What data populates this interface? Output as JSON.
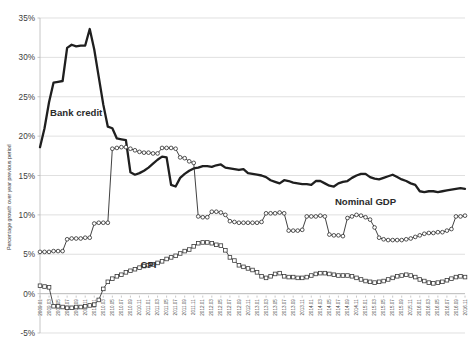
{
  "chart_data": {
    "type": "line",
    "title": "",
    "xlabel": "",
    "ylabel": "Percentage growth over year previous period",
    "ylim": [
      -5,
      35
    ],
    "ytick_labels": [
      "35%",
      "30%",
      "25%",
      "20%",
      "15%",
      "10%",
      "5%",
      "0%",
      "-5%"
    ],
    "ytick_values": [
      35,
      30,
      25,
      20,
      15,
      10,
      5,
      0,
      -5
    ],
    "grid": true,
    "legend_position": "inline-annotations",
    "annotations": [
      {
        "text": "Bank credit",
        "x": "2009.09",
        "y": 22.5
      },
      {
        "text": "Nominal GDP",
        "x": "2015.01",
        "y": 11.3
      },
      {
        "text": "CPI",
        "x": "2011.01",
        "y": 3.2
      }
    ],
    "x": [
      "2009.01",
      "2009.02",
      "2009.03",
      "2009.04",
      "2009.05",
      "2009.06",
      "2009.07",
      "2009.08",
      "2009.09",
      "2009.10",
      "2009.11",
      "2009.12",
      "2010.01",
      "2010.02",
      "2010.03",
      "2010.04",
      "2010.05",
      "2010.06",
      "2010.07",
      "2010.08",
      "2010.09",
      "2010.10",
      "2010.11",
      "2010.12",
      "2011.01",
      "2011.02",
      "2011.03",
      "2011.04",
      "2011.05",
      "2011.06",
      "2011.07",
      "2011.08",
      "2011.09",
      "2011.10",
      "2011.11",
      "2011.12",
      "2012.01",
      "2012.02",
      "2012.03",
      "2012.04",
      "2012.05",
      "2012.06",
      "2012.07",
      "2012.08",
      "2012.09",
      "2012.10",
      "2012.11",
      "2012.12",
      "2013.01",
      "2013.02",
      "2013.03",
      "2013.04",
      "2013.05",
      "2013.06",
      "2013.07",
      "2013.08",
      "2013.09",
      "2013.10",
      "2013.11",
      "2013.12",
      "2014.01",
      "2014.02",
      "2014.03",
      "2014.04",
      "2014.05",
      "2014.06",
      "2014.07",
      "2014.08",
      "2014.09",
      "2014.10",
      "2014.11",
      "2014.12",
      "2015.01",
      "2015.02",
      "2015.03",
      "2015.04",
      "2015.05",
      "2015.06",
      "2015.07",
      "2015.08",
      "2015.09",
      "2015.10",
      "2015.11",
      "2015.12",
      "2016.01",
      "2016.02",
      "2016.03",
      "2016.04",
      "2016.05",
      "2016.06",
      "2016.07",
      "2016.08",
      "2016.09",
      "2016.10",
      "2016.11"
    ],
    "xtick_labels": [
      "2009.01",
      "2009.03",
      "2009.05",
      "2009.07",
      "2009.09",
      "2009.11",
      "2010.01",
      "2010.03",
      "2010.05",
      "2010.07",
      "2010.09",
      "2010.11",
      "2011.01",
      "2011.03",
      "2011.05",
      "2011.07",
      "2011.09",
      "2011.11",
      "2012.01",
      "2012.03",
      "2012.05",
      "2012.07",
      "2012.09",
      "2012.11",
      "2013.01",
      "2013.03",
      "2013.05",
      "2013.07",
      "2013.09",
      "2013.11",
      "2014.01",
      "2014.03",
      "2014.05",
      "2014.07",
      "2014.09",
      "2014.11",
      "2015.01",
      "2015.03",
      "2015.05",
      "2015.07",
      "2015.09",
      "2015.11",
      "2016.01",
      "2016.03",
      "2016.05",
      "2016.07",
      "2016.09",
      "2016.11"
    ],
    "series": [
      {
        "name": "Bank credit",
        "marker": "none",
        "color": "#1f1f1f",
        "line_width": 2.3,
        "values": [
          18.6,
          21.0,
          24.3,
          26.8,
          26.9,
          27.0,
          31.2,
          31.6,
          31.4,
          31.5,
          31.5,
          33.6,
          31.0,
          27.5,
          24.0,
          21.2,
          21.0,
          19.7,
          19.6,
          19.5,
          15.4,
          15.1,
          15.3,
          15.6,
          16.0,
          16.5,
          17.0,
          17.4,
          17.3,
          13.8,
          13.6,
          14.7,
          15.2,
          15.6,
          15.9,
          16.0,
          16.2,
          16.2,
          16.1,
          16.3,
          16.4,
          16.0,
          15.9,
          15.8,
          15.7,
          15.8,
          15.3,
          15.2,
          15.1,
          15.0,
          14.8,
          14.4,
          14.2,
          14.0,
          14.4,
          14.3,
          14.1,
          14.0,
          13.9,
          13.9,
          13.8,
          14.3,
          14.3,
          14.0,
          13.7,
          13.6,
          14.0,
          14.2,
          14.3,
          14.7,
          15.0,
          15.2,
          15.2,
          14.8,
          14.6,
          14.5,
          14.7,
          14.9,
          15.1,
          14.8,
          14.5,
          14.3,
          14.0,
          13.8,
          13.0,
          12.9,
          13.0,
          13.0,
          12.9,
          13.0,
          13.1,
          13.2,
          13.3,
          13.4,
          13.3
        ]
      },
      {
        "name": "Nominal GDP",
        "marker": "circle",
        "color": "#2b2b2b",
        "line_width": 0.9,
        "values": [
          5.3,
          5.3,
          5.3,
          5.4,
          5.4,
          5.4,
          6.9,
          7.0,
          7.0,
          7.0,
          7.1,
          7.1,
          8.9,
          9.0,
          9.0,
          9.0,
          18.4,
          18.5,
          18.6,
          18.6,
          18.4,
          18.2,
          18.0,
          17.9,
          17.9,
          17.8,
          17.8,
          18.5,
          18.5,
          18.5,
          18.4,
          17.3,
          17.2,
          16.8,
          16.6,
          9.8,
          9.7,
          9.7,
          10.4,
          10.4,
          10.3,
          10.0,
          9.2,
          9.1,
          9.0,
          9.0,
          9.0,
          9.0,
          9.0,
          9.1,
          10.2,
          10.2,
          10.2,
          10.3,
          10.2,
          8.0,
          8.0,
          8.0,
          8.1,
          9.8,
          9.8,
          9.8,
          9.9,
          9.8,
          7.5,
          7.4,
          7.4,
          7.3,
          9.6,
          9.8,
          10.0,
          9.9,
          9.7,
          9.4,
          8.4,
          7.1,
          6.9,
          6.8,
          6.8,
          6.8,
          6.8,
          6.9,
          7.0,
          7.2,
          7.4,
          7.6,
          7.7,
          7.7,
          7.8,
          7.8,
          8.0,
          8.2,
          9.8,
          9.8,
          9.9
        ]
      },
      {
        "name": "CPI",
        "marker": "square",
        "color": "#3a3a3a",
        "line_width": 0.9,
        "values": [
          1.0,
          0.9,
          0.8,
          -1.6,
          -1.6,
          -1.7,
          -1.8,
          -1.8,
          -1.7,
          -1.7,
          -1.6,
          -1.5,
          -1.4,
          -0.8,
          0.6,
          1.5,
          1.9,
          2.2,
          2.4,
          2.7,
          2.9,
          3.1,
          3.3,
          3.5,
          3.6,
          3.7,
          3.9,
          4.1,
          4.4,
          4.6,
          4.8,
          5.1,
          5.4,
          5.6,
          6.0,
          6.4,
          6.5,
          6.5,
          6.4,
          6.2,
          6.1,
          5.5,
          4.6,
          4.2,
          3.6,
          3.4,
          3.2,
          3.0,
          2.7,
          2.2,
          2.0,
          2.2,
          2.5,
          2.6,
          2.2,
          2.1,
          2.1,
          2.0,
          2.0,
          2.1,
          2.3,
          2.5,
          2.6,
          2.6,
          2.5,
          2.4,
          2.3,
          2.3,
          2.3,
          2.2,
          2.0,
          1.8,
          1.6,
          1.5,
          1.4,
          1.5,
          1.6,
          1.8,
          2.0,
          2.2,
          2.3,
          2.4,
          2.3,
          2.1,
          1.8,
          1.6,
          1.4,
          1.3,
          1.4,
          1.5,
          1.7,
          1.9,
          2.1,
          2.2,
          2.1
        ]
      }
    ]
  },
  "plot": {
    "left": 40,
    "right": 465,
    "top": 18,
    "bottom": 333,
    "border_color": "#b8b8b8",
    "grid_color": "#d3d3d3"
  }
}
